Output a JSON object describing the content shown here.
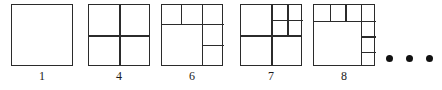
{
  "figure": {
    "line_color": "#2b2b2b",
    "background_color": "#ffffff",
    "items": [
      {
        "label": "1",
        "name": "square-1",
        "pieces": 1,
        "left": 11,
        "size": 62
      },
      {
        "label": "4",
        "name": "square-4",
        "pieces": 4,
        "left": 88,
        "size": 62
      },
      {
        "label": "6",
        "name": "square-6",
        "pieces": 6,
        "left": 161,
        "size": 62
      },
      {
        "label": "7",
        "name": "square-7",
        "pieces": 7,
        "left": 240,
        "size": 62
      },
      {
        "label": "8",
        "name": "square-8",
        "pieces": 8,
        "left": 313,
        "size": 62
      }
    ],
    "ellipsis": {
      "name": "ellipsis-dots",
      "count": 3,
      "text": "..."
    }
  },
  "captions": {
    "c1": "1",
    "c4": "4",
    "c6": "6",
    "c7": "7",
    "c8": "8"
  }
}
